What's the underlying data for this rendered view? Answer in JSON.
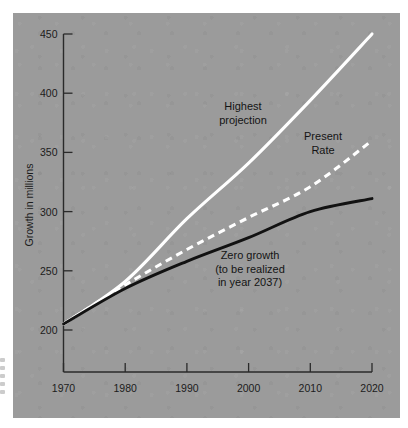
{
  "chart_data": {
    "type": "line",
    "title": "",
    "subtitle": "",
    "xlabel": "",
    "ylabel": "Growth in millions",
    "xlim": [
      1970,
      2020
    ],
    "ylim": [
      200,
      450
    ],
    "grid": false,
    "legend_position": "inline-annotations",
    "background_color": "#9b9b9b",
    "x": [
      1970,
      1980,
      1990,
      2000,
      2010,
      2020
    ],
    "x_tick_labels": [
      "1970",
      "1980",
      "1990",
      "2000",
      "2010",
      "2020"
    ],
    "y_ticks": [
      200,
      250,
      300,
      350,
      400,
      450
    ],
    "y_tick_labels": [
      "200",
      "250",
      "300",
      "350",
      "400",
      "450"
    ],
    "series": [
      {
        "name": "Highest projection",
        "color": "#ffffff",
        "style": "solid",
        "values": [
          205,
          241,
          294,
          341,
          394,
          450
        ]
      },
      {
        "name": "Present Rate",
        "color": "#ffffff",
        "style": "dashed",
        "values": [
          205,
          238,
          268,
          295,
          321,
          360
        ]
      },
      {
        "name": "Zero growth",
        "color": "#121212",
        "style": "solid",
        "values": [
          205,
          235,
          258,
          278,
          300,
          311
        ]
      }
    ],
    "annotations": [
      {
        "id": "highest",
        "lines": [
          "Highest",
          "projection"
        ],
        "x": 243,
        "y": 110
      },
      {
        "id": "present",
        "lines": [
          "Present",
          "Rate"
        ],
        "x": 323,
        "y": 140
      },
      {
        "id": "zero",
        "lines": [
          "Zero growth",
          "(to be realized",
          "in year 2037)"
        ],
        "x": 250,
        "y": 259
      }
    ]
  }
}
